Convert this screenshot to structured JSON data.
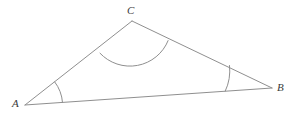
{
  "figure": {
    "name": "triangle-abc",
    "kind": "geometry-diagram",
    "background_color": "#ffffff",
    "stroke_color": "#8f8f8f",
    "label_color": "#3a3a3a",
    "stroke_width": 1,
    "canvas": {
      "width": 300,
      "height": 115
    },
    "vertices": [
      {
        "id": "A",
        "label": "A",
        "x": 25,
        "y": 105,
        "label_x": 12,
        "label_y": 107
      },
      {
        "id": "B",
        "label": "B",
        "x": 272,
        "y": 88,
        "label_x": 277,
        "label_y": 91
      },
      {
        "id": "C",
        "label": "C",
        "x": 132,
        "y": 21,
        "label_x": 127,
        "label_y": 14
      }
    ],
    "edges": [
      {
        "id": "AB",
        "from": "A",
        "to": "B",
        "path": "M 25 105 L 272 88"
      },
      {
        "id": "AC",
        "from": "A",
        "to": "C",
        "path": "M 25 105 L 132 21"
      },
      {
        "id": "CB",
        "from": "C",
        "to": "B",
        "path": "M 132 21 L 272 88"
      }
    ],
    "angle_arcs": [
      {
        "id": "angle-A",
        "vertex": "A",
        "radius": 38,
        "path": "M 62.5 102.4 A 38 38 0 0 0 54.7 81.9"
      },
      {
        "id": "angle-B",
        "vertex": "B",
        "radius": 47,
        "path": "M 225.2 91.2 A 47 47 0 0 0 229.5 65.5"
      },
      {
        "id": "angle-C",
        "vertex": "C",
        "radius": 41,
        "path": "M 100.0 53.2 A 41 41 0 0 0 168.1 40.6"
      }
    ]
  }
}
